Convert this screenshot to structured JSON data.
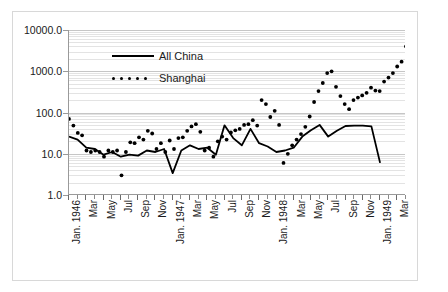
{
  "chart_data": {
    "type": "line",
    "title": "",
    "xlabel": "",
    "ylabel": "",
    "log_y": true,
    "ylim": [
      1.0,
      10000.0
    ],
    "grid": true,
    "legend_position": "top-left-inside",
    "y_ticks": [
      "1.0",
      "10.0",
      "100.0",
      "1000.0",
      "10000.0"
    ],
    "y_tick_values": [
      1,
      10,
      100,
      1000,
      10000
    ],
    "x_tick_labels": [
      "Jan. 1946",
      "Mar",
      "May",
      "Jul",
      "Sep",
      "Nov",
      "Jan. 1947",
      "Mar",
      "May",
      "Jul",
      "Sep",
      "Nov",
      "Jan. 1948",
      "Mar",
      "May",
      "Jul",
      "Sep",
      "Nov",
      "Jan. 1949",
      "Mar"
    ],
    "x_major_indices": [
      0,
      2,
      4,
      6,
      8,
      10,
      12,
      14,
      16,
      18,
      20,
      22,
      24,
      26,
      28,
      30,
      32,
      34,
      36,
      38
    ],
    "x_count": 40,
    "legend": [
      {
        "name": "All China",
        "style": "solid",
        "color": "#000000"
      },
      {
        "name": "Shanghai",
        "style": "dotted",
        "color": "#000000"
      }
    ],
    "series": [
      {
        "name": "All China",
        "style": "solid",
        "color": "#000000",
        "values": [
          26,
          22,
          14,
          13,
          9.5,
          11,
          8.5,
          9.5,
          9,
          12,
          11,
          13,
          3.4,
          12,
          16,
          13,
          14,
          9.5,
          49,
          24,
          16,
          40,
          18,
          15,
          11,
          12,
          14,
          26,
          37,
          50,
          26,
          36,
          47,
          48,
          48,
          46,
          6.0,
          null,
          null,
          null
        ]
      },
      {
        "name": "Shanghai",
        "style": "dotted",
        "color": "#000000",
        "values": [
          70,
          48,
          32,
          28,
          12,
          11,
          12,
          11,
          8.5,
          12,
          11,
          12,
          3.0,
          11,
          19,
          18,
          25,
          22,
          36,
          31,
          13,
          18,
          11,
          21,
          13,
          24,
          25,
          36,
          46,
          52,
          34,
          12,
          14,
          8.5,
          20,
          26,
          22,
          33,
          37,
          40,
          50,
          52,
          65,
          48,
          200,
          160,
          78,
          110,
          50,
          6.0,
          10,
          16,
          22,
          30,
          45,
          80,
          180,
          330,
          520,
          900,
          1000,
          420,
          250,
          160,
          120,
          200,
          230,
          260,
          300,
          400,
          340,
          330,
          560,
          700,
          900,
          1300,
          1700,
          4000
        ]
      }
    ]
  },
  "legend": {
    "all_china_label": "All China",
    "shanghai_label": "Shanghai"
  }
}
